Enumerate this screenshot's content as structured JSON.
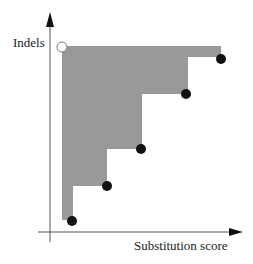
{
  "diagram": {
    "y_axis_label": "Indels",
    "x_axis_label": "Substitution score",
    "colors": {
      "region_fill": "#999999",
      "axis": "#555555",
      "point": "#111111",
      "open_point_fill": "#ffffff",
      "open_point_stroke": "#777777"
    },
    "points": [
      {
        "x": 72,
        "y": 221,
        "type": "filled"
      },
      {
        "x": 107,
        "y": 186,
        "type": "filled"
      },
      {
        "x": 141,
        "y": 149,
        "type": "filled"
      },
      {
        "x": 186,
        "y": 94,
        "type": "filled"
      },
      {
        "x": 221,
        "y": 59,
        "type": "filled"
      }
    ],
    "origin_point": {
      "x": 62,
      "y": 47,
      "type": "open"
    }
  }
}
